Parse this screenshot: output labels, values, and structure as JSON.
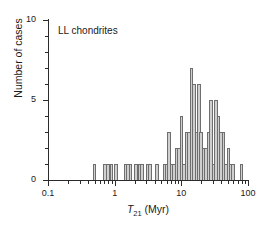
{
  "figure": {
    "annotation": "LL chondrites",
    "axis_title_y": "Number of cases",
    "axis_title_x_symbol": "T",
    "axis_title_x_sub": "21",
    "axis_title_x_unit": "(Myr)",
    "bar_fill": "#cfcfcf",
    "bar_stroke": "#6e6e6e",
    "axis_color": "#2b2b2b"
  },
  "chart_data": {
    "type": "bar",
    "title": "",
    "subtitle": "",
    "annotations": [
      "LL chondrites"
    ],
    "xlabel": "T21 (Myr)",
    "ylabel": "Number of cases",
    "xscale": "log",
    "xlim": [
      0.1,
      100
    ],
    "ylim": [
      0,
      10
    ],
    "grid": false,
    "legend": null,
    "x_tick_labels": [
      "0.1",
      "1",
      "10",
      "100"
    ],
    "x_tick_values": [
      0.1,
      1,
      10,
      100
    ],
    "y_tick_labels": [
      "0",
      "5",
      "10"
    ],
    "y_tick_values": [
      0,
      5,
      10
    ],
    "y_minor_tick_values": [
      1,
      2,
      3,
      4,
      6,
      7,
      8,
      9
    ],
    "bin_note": "logarithmic bins, ~18 bins per decade",
    "bins": [
      {
        "center": 0.5,
        "value": 1
      },
      {
        "center": 0.72,
        "value": 1
      },
      {
        "center": 0.8,
        "value": 1
      },
      {
        "center": 0.9,
        "value": 1
      },
      {
        "center": 1.05,
        "value": 1
      },
      {
        "center": 1.45,
        "value": 1
      },
      {
        "center": 1.58,
        "value": 1
      },
      {
        "center": 1.72,
        "value": 1
      },
      {
        "center": 2.1,
        "value": 1
      },
      {
        "center": 2.35,
        "value": 1
      },
      {
        "center": 2.6,
        "value": 1
      },
      {
        "center": 3.1,
        "value": 1
      },
      {
        "center": 3.4,
        "value": 1
      },
      {
        "center": 4.3,
        "value": 1
      },
      {
        "center": 5.6,
        "value": 1
      },
      {
        "center": 6.1,
        "value": 1
      },
      {
        "center": 6.6,
        "value": 3
      },
      {
        "center": 7.2,
        "value": 1
      },
      {
        "center": 7.8,
        "value": 1
      },
      {
        "center": 8.5,
        "value": 2
      },
      {
        "center": 9.3,
        "value": 2
      },
      {
        "center": 10.1,
        "value": 4
      },
      {
        "center": 11.0,
        "value": 1
      },
      {
        "center": 12.0,
        "value": 3
      },
      {
        "center": 13.0,
        "value": 3
      },
      {
        "center": 14.2,
        "value": 7
      },
      {
        "center": 15.4,
        "value": 6
      },
      {
        "center": 16.8,
        "value": 3
      },
      {
        "center": 18.3,
        "value": 6
      },
      {
        "center": 19.9,
        "value": 3
      },
      {
        "center": 21.7,
        "value": 2
      },
      {
        "center": 23.6,
        "value": 2
      },
      {
        "center": 25.7,
        "value": 3
      },
      {
        "center": 28.0,
        "value": 5
      },
      {
        "center": 30.5,
        "value": 1
      },
      {
        "center": 33.2,
        "value": 5
      },
      {
        "center": 36.1,
        "value": 4
      },
      {
        "center": 39.4,
        "value": 3
      },
      {
        "center": 42.9,
        "value": 3
      },
      {
        "center": 46.7,
        "value": 1
      },
      {
        "center": 50.8,
        "value": 2
      },
      {
        "center": 55.3,
        "value": 1
      },
      {
        "center": 60.2,
        "value": 1
      },
      {
        "center": 80.0,
        "value": 1
      }
    ]
  }
}
